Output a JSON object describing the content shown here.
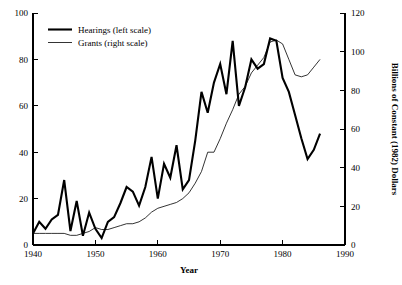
{
  "chart_data": {
    "type": "line",
    "title": "",
    "xlabel": "Year",
    "ylabel": "",
    "ylabel_right": "Billions of Constant (1982) Dollars",
    "grid": false,
    "legend_position": "top-left-inside",
    "xlim": [
      1940,
      1990
    ],
    "ylim": [
      0,
      100
    ],
    "ylim_right": [
      0,
      120
    ],
    "xticks": [
      1940,
      1950,
      1960,
      1970,
      1980,
      1990
    ],
    "xtick_labels": [
      "1940",
      "1950",
      "1960",
      "1970",
      "1980",
      "1990"
    ],
    "yticks": [
      0,
      20,
      40,
      60,
      80,
      100
    ],
    "ytick_labels": [
      "0",
      "20",
      "40",
      "60",
      "80",
      "100"
    ],
    "yticks_right": [
      0,
      20,
      40,
      60,
      80,
      100,
      120
    ],
    "ytick_labels_right": [
      "0",
      "20",
      "40",
      "60",
      "80",
      "100",
      "120"
    ],
    "series": [
      {
        "name": "Hearings (left scale)",
        "axis": "left",
        "style": "thick-solid",
        "color": "#000000",
        "x": [
          1940,
          1941,
          1942,
          1943,
          1944,
          1945,
          1946,
          1947,
          1948,
          1949,
          1950,
          1951,
          1952,
          1953,
          1954,
          1955,
          1956,
          1957,
          1958,
          1959,
          1960,
          1961,
          1962,
          1963,
          1964,
          1965,
          1966,
          1967,
          1968,
          1969,
          1970,
          1971,
          1972,
          1973,
          1974,
          1975,
          1976,
          1977,
          1978,
          1979,
          1980,
          1981,
          1982,
          1983,
          1984,
          1985,
          1986
        ],
        "values": [
          5,
          10,
          7,
          11,
          13,
          28,
          6,
          19,
          4,
          14,
          7,
          3,
          10,
          12,
          18,
          25,
          23,
          17,
          25,
          38,
          20,
          35,
          29,
          43,
          24,
          28,
          45,
          66,
          57,
          70,
          78,
          65,
          88,
          60,
          68,
          80,
          76,
          78,
          89,
          88,
          72,
          66,
          56,
          46,
          37,
          41,
          48
        ]
      },
      {
        "name": "Grants (right scale)",
        "axis": "right",
        "style": "thin-solid",
        "color": "#000000",
        "x": [
          1940,
          1941,
          1942,
          1943,
          1944,
          1945,
          1946,
          1947,
          1948,
          1949,
          1950,
          1951,
          1952,
          1953,
          1954,
          1955,
          1956,
          1957,
          1958,
          1959,
          1960,
          1961,
          1962,
          1963,
          1964,
          1965,
          1966,
          1967,
          1968,
          1969,
          1970,
          1971,
          1972,
          1973,
          1974,
          1975,
          1976,
          1977,
          1978,
          1979,
          1980,
          1981,
          1982,
          1983,
          1984,
          1985,
          1986
        ],
        "values": [
          6,
          6,
          6,
          6,
          6,
          6,
          5,
          5,
          6,
          7,
          9,
          8,
          8,
          9,
          10,
          11,
          11,
          12,
          14,
          17,
          19,
          20,
          21,
          22,
          24,
          27,
          32,
          38,
          48,
          48,
          55,
          63,
          70,
          78,
          82,
          89,
          93,
          97,
          105,
          106,
          104,
          96,
          88,
          87,
          88,
          92,
          96
        ]
      }
    ],
    "annotations": []
  },
  "legend": {
    "items": [
      {
        "label": "Hearings (left scale)",
        "style": "thick"
      },
      {
        "label": "Grants (right scale)",
        "style": "thin"
      }
    ]
  },
  "axes": {
    "x_title": "Year",
    "y_right_title": "Billions of Constant (1982) Dollars"
  }
}
